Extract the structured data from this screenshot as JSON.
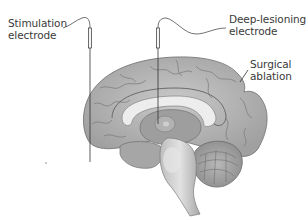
{
  "figure": {
    "labels": {
      "stimulation_electrode": "Stimulation\nelectrode",
      "deep_lesioning_electrode": "Deep-lesioning\nelectrode",
      "surgical_ablation": "Surgical\nablation"
    },
    "structures": [
      "cerebral-cortex",
      "corpus-callosum",
      "thalamus",
      "brainstem",
      "cerebellum",
      "spinal-cord"
    ],
    "colors": {
      "cortex": "#b8b8b8",
      "cortex_dark": "#8a8a8a",
      "corpus_callosum": "#ececec",
      "brainstem": "#d0d0d0",
      "cerebellum": "#a9a9a9",
      "lines": "#333333",
      "text": "#3a3a3a"
    }
  }
}
